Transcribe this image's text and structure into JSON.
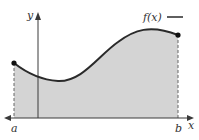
{
  "diagram": {
    "labels": {
      "y_axis": "y",
      "x_axis": "x",
      "function": "f(x)",
      "left_bound": "a",
      "right_bound": "b"
    },
    "colors": {
      "fill": "#d4d4d4",
      "curve": "#2a2a2a",
      "axis": "#3a3a3a",
      "dashed": "#666666",
      "text": "#333333"
    },
    "points": {
      "left_endpoint": {
        "x": 14,
        "y": 63
      },
      "right_endpoint": {
        "x": 178,
        "y": 35
      }
    }
  }
}
